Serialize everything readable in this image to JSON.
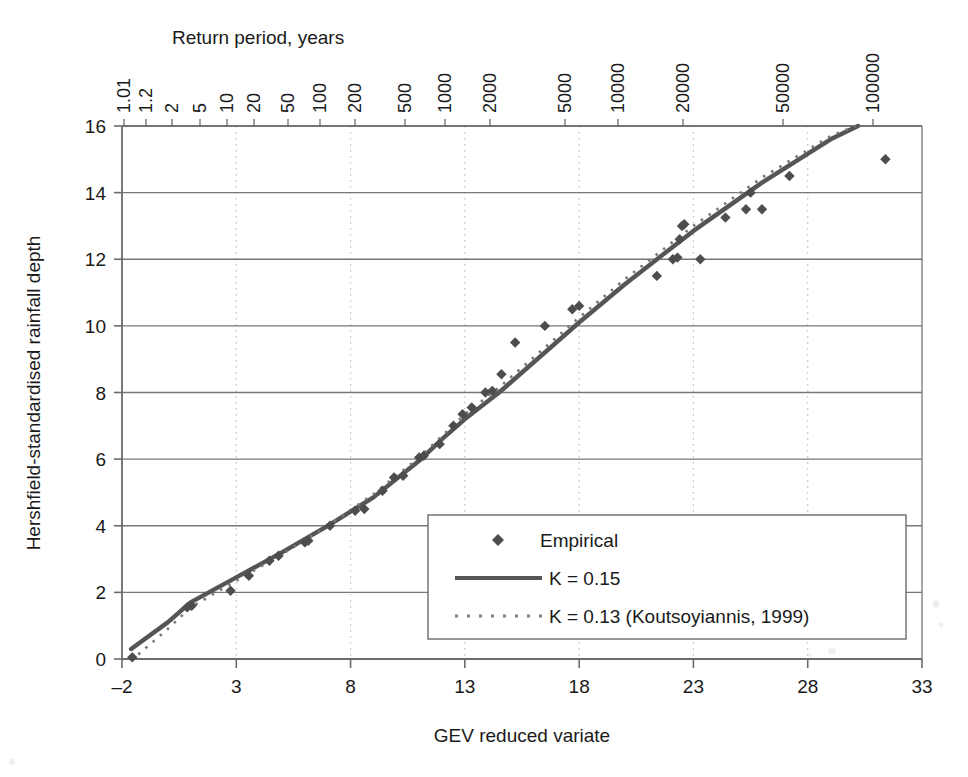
{
  "chart_data": {
    "type": "scatter",
    "title": "",
    "xlabel": "GEV reduced variate",
    "ylabel": "Hershfield-standardised rainfall depth",
    "top_axis_label": "Return period, years",
    "xlim": [
      -2,
      33
    ],
    "ylim": [
      0,
      16
    ],
    "xticks": [
      -2,
      3,
      8,
      13,
      18,
      23,
      28,
      33
    ],
    "xtick_labels": [
      "–2",
      "3",
      "8",
      "13",
      "18",
      "23",
      "28",
      "33"
    ],
    "yticks": [
      0,
      2,
      4,
      6,
      8,
      10,
      12,
      14,
      16
    ],
    "ytick_labels": [
      "0",
      "2",
      "4",
      "6",
      "8",
      "10",
      "12",
      "14",
      "16"
    ],
    "grid": "horizontal-solid-and-vertical-dotted",
    "legend_position": "lower-right-inside",
    "top_axis_ticks": [
      {
        "label": "1.01",
        "x_px": 124
      },
      {
        "label": "1.2",
        "x_px": 146
      },
      {
        "label": "2",
        "x_px": 172
      },
      {
        "label": "5",
        "x_px": 200
      },
      {
        "label": "10",
        "x_px": 227
      },
      {
        "label": "20",
        "x_px": 254
      },
      {
        "label": "50",
        "x_px": 288
      },
      {
        "label": "100",
        "x_px": 320
      },
      {
        "label": "200",
        "x_px": 355
      },
      {
        "label": "500",
        "x_px": 405
      },
      {
        "label": "1000",
        "x_px": 445
      },
      {
        "label": "2000",
        "x_px": 490
      },
      {
        "label": "5000",
        "x_px": 565
      },
      {
        "label": "10000",
        "x_px": 618
      },
      {
        "label": "20000",
        "x_px": 683
      },
      {
        "label": "50000",
        "x_px": 783
      },
      {
        "label": "100000",
        "x_px": 873
      }
    ],
    "series": [
      {
        "name": "Empirical",
        "marker": "diamond",
        "color": "#4d4d4d",
        "points": [
          [
            -1.55,
            0.05
          ],
          [
            0.85,
            1.55
          ],
          [
            1.05,
            1.6
          ],
          [
            2.75,
            2.05
          ],
          [
            3.55,
            2.5
          ],
          [
            4.45,
            2.95
          ],
          [
            4.85,
            3.1
          ],
          [
            6.0,
            3.5
          ],
          [
            6.15,
            3.55
          ],
          [
            7.1,
            4.0
          ],
          [
            8.2,
            4.45
          ],
          [
            8.6,
            4.5
          ],
          [
            9.4,
            5.05
          ],
          [
            9.9,
            5.45
          ],
          [
            10.3,
            5.5
          ],
          [
            11.0,
            6.05
          ],
          [
            11.2,
            6.1
          ],
          [
            11.9,
            6.45
          ],
          [
            12.5,
            7.0
          ],
          [
            12.9,
            7.35
          ],
          [
            13.3,
            7.55
          ],
          [
            13.9,
            8.0
          ],
          [
            14.2,
            8.05
          ],
          [
            14.6,
            8.55
          ],
          [
            15.2,
            9.5
          ],
          [
            16.5,
            10.0
          ],
          [
            17.7,
            10.5
          ],
          [
            18.0,
            10.6
          ],
          [
            21.4,
            11.5
          ],
          [
            22.1,
            12.0
          ],
          [
            22.3,
            12.05
          ],
          [
            22.4,
            12.6
          ],
          [
            22.5,
            13.0
          ],
          [
            22.6,
            13.05
          ],
          [
            23.3,
            12.0
          ],
          [
            24.4,
            13.25
          ],
          [
            25.3,
            13.5
          ],
          [
            25.5,
            14.0
          ],
          [
            26.0,
            13.5
          ],
          [
            27.2,
            14.5
          ],
          [
            31.4,
            15.0
          ]
        ]
      },
      {
        "name": "K = 0.15",
        "style": "solid",
        "color": "#555555",
        "points": [
          [
            -1.6,
            0.3
          ],
          [
            0.0,
            1.1
          ],
          [
            1.0,
            1.7
          ],
          [
            3.0,
            2.45
          ],
          [
            5.0,
            3.2
          ],
          [
            7.0,
            4.0
          ],
          [
            9.0,
            4.85
          ],
          [
            11.0,
            5.95
          ],
          [
            12.0,
            6.6
          ],
          [
            13.0,
            7.2
          ],
          [
            14.5,
            8.0
          ],
          [
            16.0,
            8.9
          ],
          [
            18.0,
            10.1
          ],
          [
            20.0,
            11.25
          ],
          [
            23.0,
            12.85
          ],
          [
            26.0,
            14.3
          ],
          [
            29.0,
            15.6
          ],
          [
            30.2,
            16.0
          ]
        ]
      },
      {
        "name": "K =  0.13 (Koutsoyiannis, 1999)",
        "style": "dotted",
        "color": "#777777",
        "points": [
          [
            -1.6,
            -0.05
          ],
          [
            0.0,
            0.9
          ],
          [
            1.0,
            1.55
          ],
          [
            3.0,
            2.35
          ],
          [
            5.0,
            3.15
          ],
          [
            7.0,
            4.0
          ],
          [
            9.0,
            4.95
          ],
          [
            11.0,
            6.05
          ],
          [
            12.0,
            6.7
          ],
          [
            13.0,
            7.35
          ],
          [
            14.5,
            8.15
          ],
          [
            16.0,
            9.05
          ],
          [
            18.0,
            10.25
          ],
          [
            20.0,
            11.4
          ],
          [
            23.0,
            13.0
          ],
          [
            26.0,
            14.45
          ],
          [
            29.0,
            15.7
          ],
          [
            30.1,
            16.0
          ]
        ]
      }
    ]
  },
  "legend": {
    "items": [
      {
        "label": "Empirical",
        "symbol": "diamond-marker"
      },
      {
        "label": "K = 0.15",
        "symbol": "solid-line"
      },
      {
        "label": "K =  0.13 (Koutsoyiannis, 1999)",
        "symbol": "dotted-line"
      }
    ]
  },
  "colors": {
    "axis": "#6b6b6b",
    "grid_solid": "#777777",
    "grid_dotted": "#bdbdbd",
    "marker": "#4d4d4d",
    "line_solid": "#555555",
    "line_dotted": "#808080",
    "text": "#1a1a1a",
    "background": "#ffffff"
  }
}
